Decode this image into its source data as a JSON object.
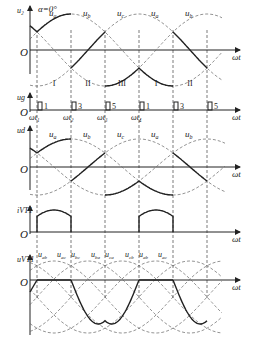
{
  "figure": {
    "panels": [
      {
        "id": "u2",
        "ylabel": "u₂",
        "annotation": "α=0°",
        "xlabel": "ωt",
        "origin": "O",
        "curve_labels": [
          "uₐ",
          "uᵦ",
          "uᶜ",
          "uₐ",
          "uᵦ"
        ],
        "curve_labels_text": [
          "ua",
          "ub",
          "uc",
          "ua",
          "ub"
        ],
        "intervals": [
          "I",
          "II",
          "III",
          "I",
          "II"
        ]
      },
      {
        "id": "ug",
        "ylabel": "ug",
        "xlabel": "ωt",
        "origin": "O",
        "pulse_numbers": [
          "1",
          "3",
          "5",
          "1",
          "3",
          "5"
        ],
        "time_labels": [
          "ωt₁",
          "ωt₂",
          "ωt₃",
          "ωt₄"
        ]
      },
      {
        "id": "ud",
        "ylabel": "ud",
        "xlabel": "ωt",
        "origin": "O",
        "curve_labels_text": [
          "ua",
          "ub",
          "uc",
          "ua",
          "ub"
        ]
      },
      {
        "id": "ivt1",
        "ylabel": "iVT1",
        "xlabel": "ωt",
        "origin": "O"
      },
      {
        "id": "uvt1",
        "ylabel": "uVT1",
        "xlabel": "ωt",
        "origin": "O",
        "curve_labels_text": [
          "uab",
          "uac",
          "ubc",
          "uba",
          "uca",
          "ucb",
          "uab",
          "uac"
        ]
      }
    ]
  }
}
